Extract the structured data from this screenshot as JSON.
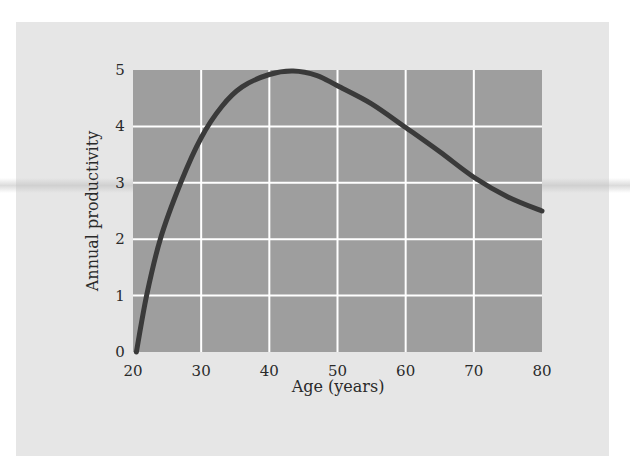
{
  "chart_data": {
    "type": "line",
    "title": "",
    "xlabel": "Age (years)",
    "ylabel": "Annual productivity",
    "xlim": [
      20,
      80
    ],
    "ylim": [
      0,
      5
    ],
    "x_ticks": [
      "20",
      "30",
      "40",
      "50",
      "60",
      "70",
      "80"
    ],
    "y_ticks": [
      "0",
      "1",
      "2",
      "3",
      "4",
      "5"
    ],
    "grid": true,
    "legend": null,
    "series": [
      {
        "name": "Annual productivity",
        "x": [
          20.5,
          22,
          24,
          27,
          30,
          33,
          36,
          40,
          43.5,
          47,
          50,
          55,
          60,
          65,
          70,
          75,
          80
        ],
        "values": [
          0,
          1.0,
          2.0,
          3.0,
          3.8,
          4.35,
          4.7,
          4.92,
          4.98,
          4.9,
          4.72,
          4.4,
          3.98,
          3.55,
          3.1,
          2.75,
          2.5
        ]
      }
    ],
    "colors": {
      "plot_background": "#9e9e9e",
      "gridline": "#ffffff",
      "line": "#3a3a3a",
      "panel": "#e6e6e6"
    }
  }
}
